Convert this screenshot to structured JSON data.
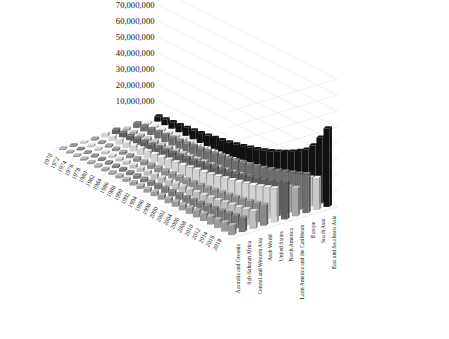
{
  "chart_data": {
    "type": "bar",
    "title": "",
    "subtitle": "",
    "xlabel": "",
    "ylabel": "",
    "zlabel": "",
    "projection": "3d-grouped-bars",
    "grid": true,
    "legend_position": "none",
    "ylim": [
      0,
      80000000
    ],
    "yticks": [
      10000000,
      20000000,
      30000000,
      40000000,
      50000000,
      60000000,
      70000000,
      80000000
    ],
    "ytick_labels": [
      "10,000,000",
      "20,000,000",
      "30,000,000",
      "40,000,000",
      "50,000,000",
      "60,000,000",
      "70,000,000",
      "80,000,000"
    ],
    "categories": [
      "1970",
      "1972",
      "1974",
      "1976",
      "1978",
      "1980",
      "1982",
      "1984",
      "1986",
      "1988",
      "1990",
      "1992",
      "1994",
      "1996",
      "1998",
      "2000",
      "2002",
      "2004",
      "2006",
      "2008",
      "2010",
      "2012",
      "2014",
      "2016",
      "2018"
    ],
    "series": [
      {
        "name": "Australia and Oceania",
        "color": "#9a9a9a",
        "values": [
          900000,
          1000000,
          1100000,
          1200000,
          1300000,
          1400000,
          1500000,
          1650000,
          1800000,
          1950000,
          2100000,
          2300000,
          2500000,
          2700000,
          2900000,
          3100000,
          3400000,
          3700000,
          4000000,
          4300000,
          4600000,
          5000000,
          5400000,
          5800000,
          6200000
        ]
      },
      {
        "name": "Sub-Saharan Africa",
        "color": "#777777",
        "values": [
          800000,
          900000,
          1000000,
          1100000,
          1250000,
          1400000,
          1550000,
          1700000,
          1900000,
          2100000,
          2300000,
          2550000,
          2800000,
          3100000,
          3400000,
          3700000,
          4100000,
          4500000,
          5000000,
          5500000,
          6000000,
          6700000,
          7400000,
          8100000,
          8900000
        ]
      },
      {
        "name": "Central and Western Asia",
        "color": "#bdbdbd",
        "values": [
          1000000,
          1150000,
          1300000,
          1450000,
          1600000,
          1800000,
          2000000,
          2200000,
          2450000,
          2700000,
          3000000,
          3300000,
          3600000,
          3950000,
          4300000,
          4700000,
          5200000,
          5700000,
          6300000,
          6900000,
          7600000,
          8400000,
          9200000,
          10100000,
          11000000
        ]
      },
      {
        "name": "Arab World",
        "color": "#8a8a8a",
        "values": [
          1100000,
          1250000,
          1400000,
          1600000,
          1800000,
          2000000,
          2250000,
          2500000,
          2800000,
          3100000,
          3450000,
          3800000,
          4200000,
          4600000,
          5100000,
          5600000,
          6200000,
          6800000,
          7500000,
          8300000,
          9100000,
          10000000,
          11000000,
          12000000,
          13100000
        ]
      },
      {
        "name": "United States",
        "color": "#d2d2d2",
        "values": [
          2600000,
          2900000,
          3200000,
          3500000,
          3800000,
          4200000,
          4600000,
          5000000,
          5500000,
          6000000,
          6600000,
          7200000,
          7900000,
          8600000,
          9400000,
          10200000,
          11100000,
          12100000,
          13200000,
          14300000,
          15500000,
          16800000,
          18200000,
          19700000,
          21300000
        ]
      },
      {
        "name": "North America",
        "color": "#5f5f5f",
        "values": [
          2800000,
          3100000,
          3450000,
          3800000,
          4150000,
          4550000,
          5000000,
          5450000,
          6000000,
          6550000,
          7200000,
          7850000,
          8600000,
          9400000,
          10250000,
          11100000,
          12100000,
          13200000,
          14400000,
          15600000,
          16900000,
          18300000,
          19800000,
          21400000,
          23200000
        ]
      },
      {
        "name": "Latin America and the Caribbean",
        "color": "#a8a8a8",
        "values": [
          1500000,
          1700000,
          1950000,
          2200000,
          2500000,
          2800000,
          3150000,
          3500000,
          3900000,
          4350000,
          4800000,
          5300000,
          5850000,
          6400000,
          7000000,
          7700000,
          8500000,
          9300000,
          10200000,
          11200000,
          12300000,
          13500000,
          14800000,
          16200000,
          17700000
        ]
      },
      {
        "name": "Europe",
        "color": "#6e6e6e",
        "values": [
          3000000,
          3350000,
          3700000,
          4100000,
          4500000,
          4950000,
          5400000,
          5900000,
          6450000,
          7000000,
          7650000,
          8350000,
          9100000,
          9900000,
          10800000,
          11700000,
          12700000,
          13800000,
          15000000,
          16300000,
          17700000,
          19200000,
          20800000,
          22500000,
          24300000
        ]
      },
      {
        "name": "South Asia",
        "color": "#c9c9c9",
        "values": [
          1200000,
          1350000,
          1550000,
          1750000,
          2000000,
          2250000,
          2550000,
          2850000,
          3200000,
          3600000,
          4050000,
          4550000,
          5100000,
          5700000,
          6400000,
          7200000,
          8100000,
          9100000,
          10200000,
          11400000,
          12800000,
          14300000,
          16000000,
          17900000,
          20000000
        ]
      },
      {
        "name": "East and Southeast Asia",
        "color": "#111111",
        "values": [
          3200000,
          3600000,
          4050000,
          4500000,
          5000000,
          5550000,
          6150000,
          6800000,
          7550000,
          8350000,
          9250000,
          10200000,
          11300000,
          12500000,
          13800000,
          15300000,
          17000000,
          18900000,
          21000000,
          23400000,
          26000000,
          29000000,
          34000000,
          41000000,
          49000000
        ]
      }
    ]
  },
  "axes": {
    "y_axis_name": "value-axis",
    "x_axis_name": "year-axis",
    "z_axis_name": "region-axis"
  }
}
